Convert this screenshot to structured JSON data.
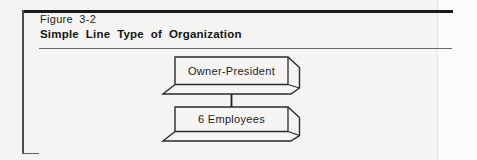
{
  "figure": {
    "label": "Figure 3-2",
    "title": "Simple Line Type of Organization"
  },
  "diagram": {
    "type": "org-chart",
    "nodes": [
      {
        "id": "owner-president",
        "label": "Owner-President"
      },
      {
        "id": "employees",
        "label": "6 Employees"
      }
    ],
    "edges": [
      {
        "from": "owner-president",
        "to": "employees"
      }
    ]
  },
  "colors": {
    "page_background": "#f5f4f2",
    "heavy_rule": "#1a1a1a",
    "light_rule": "#6b6b6b",
    "box_stroke": "#2a2a2a",
    "text": "#1c1c1c"
  }
}
